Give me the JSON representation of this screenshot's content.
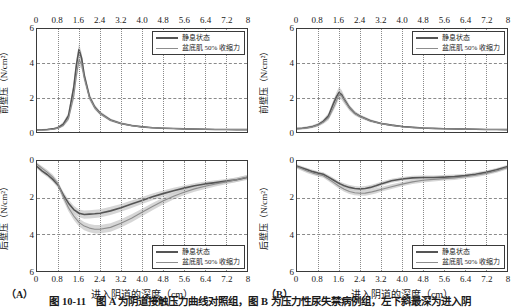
{
  "figure": {
    "caption": "图 10-11　图 A 为阴道接触压力曲线对照组，图 B 为压力性尿失禁病例组，左下斜最深为进入阴"
  },
  "axes": {
    "x_ticks": [
      "0",
      "0.8",
      "1.6",
      "2.4",
      "3.2",
      "4.0",
      "4.8",
      "5.6",
      "6.4",
      "7.2",
      "8"
    ],
    "y_ticks_top": [
      "6",
      "4",
      "2",
      "0"
    ],
    "y_ticks_bottom": [
      "0",
      "2",
      "4",
      "6"
    ],
    "x_title": "进入阴道的深度（cm）",
    "y_title_top": "前壁压（N/cm²）",
    "y_title_bottom": "后壁压（N/cm²）"
  },
  "legend": {
    "series1": "静息状态",
    "series2": "盆底肌 50% 收缩力"
  },
  "panels": [
    {
      "tag": "（A）"
    },
    {
      "tag": "（B）"
    }
  ],
  "colors": {
    "series1": "#555555",
    "series2": "#8d8d8d",
    "band": "#c8c8c8",
    "axis": "#3a3a3a",
    "grid": "#8a8a8a"
  },
  "chart_data": [
    {
      "type": "line",
      "panel": "A",
      "position": "top",
      "title": "",
      "xlabel": "进入阴道的深度（cm）",
      "ylabel": "前壁压（N/cm²）",
      "xlim": [
        0,
        8
      ],
      "ylim": [
        0,
        6
      ],
      "y_inverted": false,
      "grid": true,
      "legend_position": "top-right",
      "x": [
        0,
        0.2,
        0.4,
        0.6,
        0.8,
        1.0,
        1.2,
        1.4,
        1.5,
        1.6,
        1.7,
        1.8,
        2.0,
        2.2,
        2.4,
        2.8,
        3.2,
        3.6,
        4.0,
        4.4,
        4.8,
        5.2,
        5.6,
        6.0,
        6.4,
        6.8,
        7.2,
        7.6,
        8.0
      ],
      "series": [
        {
          "name": "静息状态",
          "values": [
            0.12,
            0.13,
            0.15,
            0.18,
            0.25,
            0.45,
            0.95,
            2.6,
            3.9,
            4.8,
            4.3,
            3.3,
            2.05,
            1.45,
            1.1,
            0.7,
            0.5,
            0.38,
            0.3,
            0.25,
            0.22,
            0.2,
            0.18,
            0.17,
            0.16,
            0.15,
            0.15,
            0.14,
            0.14
          ],
          "band_low": [
            0.08,
            0.09,
            0.11,
            0.13,
            0.18,
            0.35,
            0.8,
            2.3,
            3.55,
            4.45,
            4.0,
            3.05,
            1.88,
            1.32,
            1.0,
            0.62,
            0.44,
            0.33,
            0.26,
            0.22,
            0.19,
            0.17,
            0.16,
            0.15,
            0.14,
            0.13,
            0.13,
            0.12,
            0.12
          ],
          "band_high": [
            0.17,
            0.18,
            0.2,
            0.24,
            0.33,
            0.58,
            1.12,
            2.92,
            4.28,
            5.15,
            4.62,
            3.58,
            2.24,
            1.6,
            1.22,
            0.79,
            0.57,
            0.44,
            0.35,
            0.29,
            0.26,
            0.23,
            0.21,
            0.2,
            0.19,
            0.18,
            0.17,
            0.17,
            0.16
          ]
        },
        {
          "name": "盆底肌 50% 收缩力",
          "values": [
            0.1,
            0.11,
            0.13,
            0.16,
            0.22,
            0.38,
            0.78,
            2.1,
            3.3,
            4.2,
            3.95,
            3.15,
            2.0,
            1.42,
            1.08,
            0.68,
            0.49,
            0.37,
            0.29,
            0.25,
            0.22,
            0.2,
            0.18,
            0.17,
            0.16,
            0.15,
            0.15,
            0.14,
            0.14
          ],
          "band_low": [
            0.07,
            0.08,
            0.09,
            0.12,
            0.17,
            0.3,
            0.66,
            1.85,
            3.0,
            3.88,
            3.65,
            2.9,
            1.84,
            1.3,
            0.99,
            0.61,
            0.44,
            0.33,
            0.26,
            0.22,
            0.19,
            0.17,
            0.16,
            0.15,
            0.14,
            0.13,
            0.13,
            0.12,
            0.12
          ],
          "band_high": [
            0.14,
            0.15,
            0.17,
            0.21,
            0.28,
            0.48,
            0.92,
            2.38,
            3.62,
            4.54,
            4.26,
            3.42,
            2.17,
            1.55,
            1.19,
            0.76,
            0.55,
            0.42,
            0.33,
            0.28,
            0.25,
            0.23,
            0.21,
            0.2,
            0.19,
            0.18,
            0.17,
            0.17,
            0.16
          ]
        }
      ]
    },
    {
      "type": "line",
      "panel": "A",
      "position": "bottom",
      "title": "",
      "xlabel": "进入阴道的深度（cm）",
      "ylabel": "后壁压（N/cm²）",
      "xlim": [
        0,
        8
      ],
      "ylim": [
        0,
        6
      ],
      "y_inverted": true,
      "grid": true,
      "legend_position": "bottom-right",
      "x": [
        0,
        0.2,
        0.4,
        0.6,
        0.8,
        1.0,
        1.2,
        1.4,
        1.6,
        1.8,
        2.0,
        2.2,
        2.4,
        2.8,
        3.2,
        3.6,
        4.0,
        4.4,
        4.8,
        5.2,
        5.6,
        6.0,
        6.4,
        6.8,
        7.2,
        7.6,
        8.0
      ],
      "series": [
        {
          "name": "静息状态",
          "values": [
            0.3,
            0.55,
            0.75,
            1.0,
            1.3,
            1.85,
            2.3,
            2.65,
            2.85,
            2.92,
            2.9,
            2.88,
            2.85,
            2.72,
            2.55,
            2.35,
            2.15,
            1.95,
            1.78,
            1.62,
            1.48,
            1.35,
            1.25,
            1.18,
            1.1,
            1.02,
            0.9
          ],
          "band_low": [
            0.18,
            0.42,
            0.62,
            0.86,
            1.14,
            1.66,
            2.1,
            2.44,
            2.64,
            2.7,
            2.68,
            2.66,
            2.63,
            2.5,
            2.34,
            2.15,
            1.96,
            1.77,
            1.61,
            1.46,
            1.33,
            1.21,
            1.12,
            1.05,
            0.98,
            0.9,
            0.78
          ],
          "band_high": [
            0.42,
            0.68,
            0.89,
            1.15,
            1.47,
            2.05,
            2.51,
            2.87,
            3.07,
            3.15,
            3.13,
            3.11,
            3.08,
            2.95,
            2.77,
            2.56,
            2.35,
            2.14,
            1.96,
            1.79,
            1.64,
            1.5,
            1.39,
            1.32,
            1.23,
            1.15,
            1.03
          ]
        },
        {
          "name": "盆底肌 50% 收缩力",
          "values": [
            0.18,
            0.4,
            0.62,
            0.88,
            1.25,
            1.95,
            2.55,
            3.0,
            3.35,
            3.55,
            3.66,
            3.72,
            3.72,
            3.62,
            3.4,
            3.12,
            2.8,
            2.48,
            2.18,
            1.92,
            1.7,
            1.52,
            1.38,
            1.25,
            1.14,
            1.02,
            0.88
          ],
          "band_low": [
            0.08,
            0.28,
            0.49,
            0.74,
            1.09,
            1.76,
            2.35,
            2.79,
            3.14,
            3.33,
            3.44,
            3.49,
            3.49,
            3.39,
            3.18,
            2.91,
            2.6,
            2.29,
            2.0,
            1.75,
            1.54,
            1.37,
            1.24,
            1.12,
            1.01,
            0.9,
            0.76
          ],
          "band_high": [
            0.29,
            0.53,
            0.76,
            1.03,
            1.42,
            2.15,
            2.76,
            3.22,
            3.57,
            3.78,
            3.89,
            3.96,
            3.96,
            3.86,
            3.63,
            3.34,
            3.01,
            2.68,
            2.37,
            2.1,
            1.87,
            1.68,
            1.53,
            1.39,
            1.27,
            1.15,
            1.0
          ]
        }
      ]
    },
    {
      "type": "line",
      "panel": "B",
      "position": "top",
      "title": "",
      "xlabel": "进入阴道的深度（cm）",
      "ylabel": "前壁压（N/cm²）",
      "xlim": [
        0,
        8
      ],
      "ylim": [
        0,
        6
      ],
      "y_inverted": false,
      "grid": true,
      "legend_position": "top-right",
      "x": [
        0,
        0.2,
        0.4,
        0.6,
        0.8,
        1.0,
        1.2,
        1.4,
        1.5,
        1.6,
        1.7,
        1.8,
        2.0,
        2.2,
        2.4,
        2.8,
        3.2,
        3.6,
        4.0,
        4.4,
        4.8,
        5.2,
        5.6,
        6.0,
        6.4,
        6.8,
        7.2,
        7.6,
        8.0
      ],
      "series": [
        {
          "name": "静息状态",
          "values": [
            0.2,
            0.22,
            0.26,
            0.32,
            0.42,
            0.62,
            0.95,
            1.7,
            2.05,
            2.3,
            2.18,
            1.9,
            1.42,
            1.1,
            0.92,
            0.66,
            0.5,
            0.4,
            0.32,
            0.27,
            0.23,
            0.21,
            0.19,
            0.18,
            0.17,
            0.16,
            0.15,
            0.15,
            0.14
          ],
          "band_low": [
            0.14,
            0.16,
            0.19,
            0.25,
            0.33,
            0.51,
            0.81,
            1.5,
            1.83,
            2.05,
            1.95,
            1.7,
            1.27,
            0.99,
            0.83,
            0.59,
            0.45,
            0.35,
            0.28,
            0.24,
            0.2,
            0.18,
            0.17,
            0.16,
            0.15,
            0.14,
            0.13,
            0.13,
            0.12
          ],
          "band_high": [
            0.26,
            0.29,
            0.34,
            0.41,
            0.53,
            0.75,
            1.11,
            1.92,
            2.3,
            2.62,
            2.45,
            2.12,
            1.58,
            1.22,
            1.02,
            0.74,
            0.56,
            0.45,
            0.37,
            0.31,
            0.27,
            0.24,
            0.22,
            0.21,
            0.2,
            0.19,
            0.18,
            0.17,
            0.17
          ]
        },
        {
          "name": "盆底肌 50% 收缩力",
          "values": [
            0.18,
            0.2,
            0.24,
            0.3,
            0.4,
            0.57,
            0.82,
            1.45,
            1.8,
            2.18,
            2.1,
            1.85,
            1.4,
            1.08,
            0.9,
            0.64,
            0.49,
            0.39,
            0.31,
            0.26,
            0.23,
            0.2,
            0.19,
            0.18,
            0.17,
            0.16,
            0.15,
            0.15,
            0.14
          ],
          "band_low": [
            0.12,
            0.14,
            0.17,
            0.23,
            0.31,
            0.46,
            0.69,
            1.26,
            1.58,
            1.93,
            1.86,
            1.64,
            1.24,
            0.96,
            0.8,
            0.57,
            0.43,
            0.34,
            0.27,
            0.23,
            0.2,
            0.18,
            0.17,
            0.16,
            0.15,
            0.14,
            0.13,
            0.13,
            0.12
          ],
          "band_high": [
            0.24,
            0.27,
            0.32,
            0.38,
            0.5,
            0.69,
            0.96,
            1.65,
            2.03,
            2.46,
            2.36,
            2.07,
            1.57,
            1.21,
            1.01,
            0.72,
            0.56,
            0.44,
            0.36,
            0.3,
            0.26,
            0.23,
            0.22,
            0.21,
            0.2,
            0.19,
            0.18,
            0.17,
            0.17
          ]
        }
      ]
    },
    {
      "type": "line",
      "panel": "B",
      "position": "bottom",
      "title": "",
      "xlabel": "进入阴道的深度（cm）",
      "ylabel": "后壁压（N/cm²）",
      "xlim": [
        0,
        8
      ],
      "ylim": [
        0,
        6
      ],
      "y_inverted": true,
      "grid": true,
      "legend_position": "bottom-right",
      "x": [
        0,
        0.2,
        0.4,
        0.6,
        0.8,
        1.0,
        1.2,
        1.4,
        1.6,
        1.8,
        2.0,
        2.2,
        2.4,
        2.6,
        2.8,
        3.0,
        3.2,
        3.6,
        4.0,
        4.4,
        4.8,
        5.2,
        5.6,
        6.0,
        6.4,
        6.8,
        7.2,
        7.6,
        8.0
      ],
      "series": [
        {
          "name": "静息状态",
          "values": [
            0.28,
            0.38,
            0.48,
            0.58,
            0.66,
            0.72,
            0.88,
            1.05,
            1.22,
            1.35,
            1.44,
            1.5,
            1.52,
            1.5,
            1.44,
            1.35,
            1.25,
            1.08,
            0.98,
            0.92,
            0.9,
            0.9,
            0.88,
            0.85,
            0.8,
            0.72,
            0.62,
            0.48,
            0.32
          ],
          "band_low": [
            0.18,
            0.28,
            0.38,
            0.48,
            0.56,
            0.62,
            0.77,
            0.93,
            1.1,
            1.22,
            1.31,
            1.37,
            1.39,
            1.37,
            1.31,
            1.23,
            1.13,
            0.97,
            0.87,
            0.81,
            0.79,
            0.79,
            0.77,
            0.74,
            0.7,
            0.62,
            0.52,
            0.38,
            0.22
          ],
          "band_high": [
            0.38,
            0.48,
            0.58,
            0.68,
            0.77,
            0.83,
            0.99,
            1.17,
            1.34,
            1.48,
            1.57,
            1.63,
            1.65,
            1.63,
            1.57,
            1.48,
            1.37,
            1.19,
            1.09,
            1.03,
            1.01,
            1.01,
            0.99,
            0.96,
            0.9,
            0.82,
            0.72,
            0.58,
            0.42
          ]
        },
        {
          "name": "盆底肌 50% 收缩力",
          "values": [
            0.32,
            0.44,
            0.56,
            0.66,
            0.74,
            0.8,
            0.98,
            1.18,
            1.38,
            1.54,
            1.66,
            1.73,
            1.76,
            1.75,
            1.7,
            1.63,
            1.55,
            1.4,
            1.26,
            1.14,
            1.05,
            1.0,
            0.96,
            0.92,
            0.86,
            0.78,
            0.68,
            0.54,
            0.36
          ],
          "band_low": [
            0.22,
            0.34,
            0.45,
            0.55,
            0.63,
            0.69,
            0.86,
            1.05,
            1.25,
            1.4,
            1.52,
            1.59,
            1.62,
            1.61,
            1.56,
            1.49,
            1.42,
            1.27,
            1.14,
            1.02,
            0.93,
            0.88,
            0.85,
            0.81,
            0.76,
            0.68,
            0.58,
            0.44,
            0.26
          ],
          "band_high": [
            0.42,
            0.54,
            0.67,
            0.77,
            0.85,
            0.91,
            1.1,
            1.31,
            1.51,
            1.68,
            1.8,
            1.87,
            1.9,
            1.89,
            1.84,
            1.77,
            1.68,
            1.53,
            1.38,
            1.26,
            1.17,
            1.12,
            1.07,
            1.03,
            0.96,
            0.88,
            0.78,
            0.64,
            0.46
          ]
        }
      ]
    }
  ]
}
